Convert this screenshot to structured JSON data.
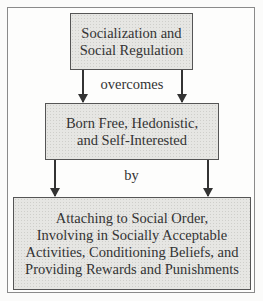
{
  "diagram": {
    "box_top": {
      "lines": [
        "Socialization and",
        "Social Regulation"
      ]
    },
    "connector_1": "overcomes",
    "box_middle": {
      "lines": [
        "Born Free, Hedonistic,",
        "and Self-Interested"
      ]
    },
    "connector_2": "by",
    "box_bottom": {
      "lines": [
        "Attaching to Social Order,",
        "Involving in Socially Acceptable",
        "Activities, Conditioning Beliefs, and",
        "Providing Rewards and Punishments"
      ]
    },
    "colors": {
      "box_fill": "#e6e6e3",
      "border": "#555555",
      "frame": "#8a8a8a",
      "text": "#333333"
    }
  }
}
